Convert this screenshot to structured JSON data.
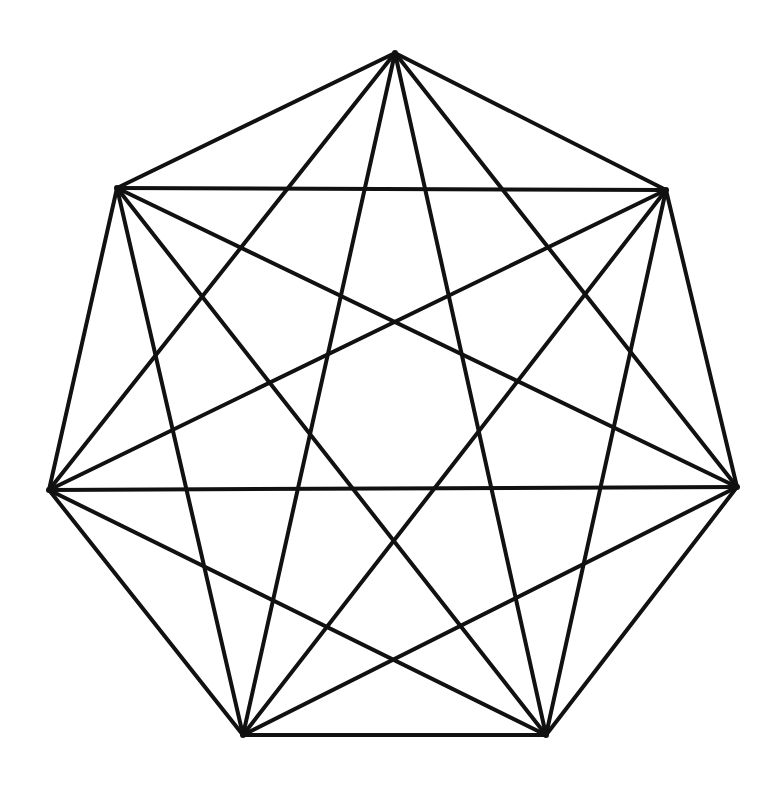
{
  "diagram": {
    "type": "complete-graph",
    "name": "K7",
    "stroke_color": "#111111",
    "background": "#ffffff",
    "stroke_width": 4,
    "vertices": [
      {
        "id": "v0",
        "x": 395,
        "y": 53
      },
      {
        "id": "v1",
        "x": 666,
        "y": 190
      },
      {
        "id": "v2",
        "x": 737,
        "y": 487
      },
      {
        "id": "v3",
        "x": 546,
        "y": 735
      },
      {
        "id": "v4",
        "x": 243,
        "y": 735
      },
      {
        "id": "v5",
        "x": 49,
        "y": 490
      },
      {
        "id": "v6",
        "x": 117,
        "y": 188
      }
    ]
  }
}
